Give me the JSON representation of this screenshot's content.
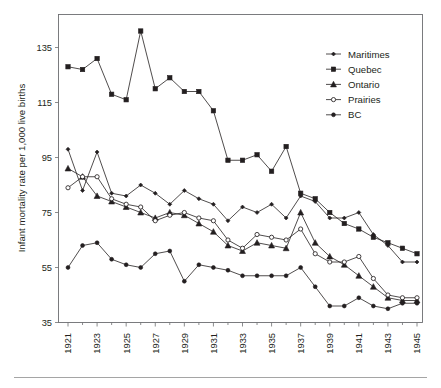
{
  "chart_data": {
    "type": "line",
    "title": "",
    "xlabel": "",
    "ylabel": "Infant mortality rate per 1,000 live births",
    "xlim": [
      1921,
      1945
    ],
    "ylim": [
      35,
      140
    ],
    "yticks": [
      35,
      55,
      75,
      95,
      115,
      135
    ],
    "ytick_labels": [
      "35",
      "55",
      "75",
      "95",
      "115",
      "135"
    ],
    "xticks": [
      1921,
      1922,
      1923,
      1924,
      1925,
      1926,
      1927,
      1928,
      1929,
      1930,
      1931,
      1932,
      1933,
      1934,
      1935,
      1936,
      1937,
      1938,
      1939,
      1940,
      1941,
      1942,
      1943,
      1944,
      1945
    ],
    "xtick_labels": [
      "1921",
      "",
      "1923",
      "",
      "1925",
      "",
      "1927",
      "",
      "1929",
      "",
      "1931",
      "",
      "1933",
      "",
      "1935",
      "",
      "1937",
      "",
      "1939",
      "",
      "1941",
      "",
      "1943",
      "",
      "1945"
    ],
    "x": [
      1921,
      1922,
      1923,
      1924,
      1925,
      1926,
      1927,
      1928,
      1929,
      1930,
      1931,
      1932,
      1933,
      1934,
      1935,
      1936,
      1937,
      1938,
      1939,
      1940,
      1941,
      1942,
      1943,
      1944,
      1945
    ],
    "grid": false,
    "legend_position": "upper right",
    "series": [
      {
        "name": "Maritimes",
        "marker": "small-diamond",
        "marker_filled": true,
        "values": [
          98,
          83,
          97,
          82,
          81,
          85,
          82,
          78,
          83,
          80,
          78,
          72,
          77,
          75,
          78,
          73,
          81,
          79,
          73,
          73,
          75,
          67,
          63,
          57,
          57
        ]
      },
      {
        "name": "Quebec",
        "marker": "square",
        "marker_filled": true,
        "values": [
          128,
          127,
          131,
          118,
          116,
          141,
          120,
          124,
          119,
          119,
          112,
          94,
          94,
          96,
          90,
          99,
          82,
          80,
          75,
          71,
          69,
          66,
          64,
          62,
          60
        ]
      },
      {
        "name": "Ontario",
        "marker": "triangle",
        "marker_filled": true,
        "values": [
          91,
          88,
          81,
          79,
          77,
          75,
          73,
          75,
          74,
          71,
          68,
          63,
          61,
          64,
          63,
          62,
          75,
          64,
          59,
          56,
          52,
          48,
          44,
          43,
          43
        ]
      },
      {
        "name": "Prairies",
        "marker": "circle",
        "marker_filled": false,
        "values": [
          84,
          88,
          88,
          80,
          78,
          77,
          72,
          74,
          75,
          73,
          72,
          65,
          62,
          67,
          66,
          65,
          69,
          60,
          57,
          57,
          59,
          51,
          45,
          44,
          44
        ]
      },
      {
        "name": "BC",
        "marker": "circle",
        "marker_filled": true,
        "values": [
          55,
          63,
          64,
          58,
          56,
          55,
          60,
          61,
          50,
          56,
          55,
          54,
          52,
          52,
          52,
          52,
          55,
          48,
          41,
          41,
          44,
          41,
          40,
          42,
          42
        ]
      }
    ]
  },
  "legend": {
    "items": [
      {
        "label": "Maritimes"
      },
      {
        "label": "Quebec"
      },
      {
        "label": "Ontario"
      },
      {
        "label": "Prairies"
      },
      {
        "label": "BC"
      }
    ]
  }
}
